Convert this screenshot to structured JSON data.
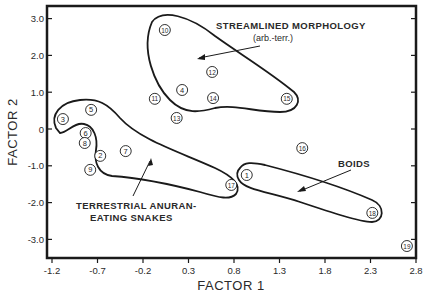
{
  "chart_data": {
    "type": "scatter",
    "title": "",
    "xlabel": "FACTOR 1",
    "ylabel": "FACTOR 2",
    "xlim": [
      -1.2,
      2.8
    ],
    "ylim": [
      -3.5,
      3.3
    ],
    "grid": false,
    "x_ticks": [
      -1.2,
      -0.7,
      -0.2,
      0.3,
      0.8,
      1.3,
      1.8,
      2.3,
      2.8
    ],
    "x_tick_labels": [
      "-1.2",
      "-0.7",
      "-0.2",
      "0.3",
      "0.8",
      "1.3",
      "1.8",
      "2.3",
      "2.8"
    ],
    "y_ticks": [
      3.0,
      2.0,
      1.0,
      0,
      -1.0,
      -2.0,
      -3.0
    ],
    "y_tick_labels": [
      "3.0",
      "2.0",
      "1.0",
      "0",
      "-1.0",
      "-2.0",
      "-3.0"
    ],
    "points": [
      {
        "label": "1",
        "x": 0.94,
        "y": -1.25
      },
      {
        "label": "2",
        "x": -0.67,
        "y": -0.73
      },
      {
        "label": "3",
        "x": -1.08,
        "y": 0.27
      },
      {
        "label": "4",
        "x": 0.23,
        "y": 1.06
      },
      {
        "label": "5",
        "x": -0.77,
        "y": 0.52
      },
      {
        "label": "6",
        "x": -0.83,
        "y": -0.11
      },
      {
        "label": "7",
        "x": -0.39,
        "y": -0.6
      },
      {
        "label": "8",
        "x": -0.84,
        "y": -0.38
      },
      {
        "label": "9",
        "x": -0.78,
        "y": -1.11
      },
      {
        "label": "10",
        "x": 0.04,
        "y": 2.69
      },
      {
        "label": "11",
        "x": -0.07,
        "y": 0.82
      },
      {
        "label": "12",
        "x": 0.56,
        "y": 1.55
      },
      {
        "label": "13",
        "x": 0.17,
        "y": 0.3
      },
      {
        "label": "14",
        "x": 0.57,
        "y": 0.84
      },
      {
        "label": "15",
        "x": 1.38,
        "y": 0.82
      },
      {
        "label": "16",
        "x": 1.55,
        "y": -0.52
      },
      {
        "label": "17",
        "x": 0.77,
        "y": -1.52
      },
      {
        "label": "18",
        "x": 2.32,
        "y": -2.28
      },
      {
        "label": "19",
        "x": 2.7,
        "y": -3.18
      }
    ],
    "groups": [
      {
        "name": "streamlined",
        "members": [
          "10",
          "12",
          "4",
          "14",
          "15"
        ]
      },
      {
        "name": "terrestrial",
        "members": [
          "3",
          "5",
          "6",
          "8",
          "2",
          "9",
          "7",
          "17"
        ]
      },
      {
        "name": "boids",
        "members": [
          "1",
          "18"
        ]
      }
    ],
    "annotations": [
      {
        "id": "streamlined",
        "lines": [
          "STREAMLINED MORPHOLOGY",
          "(arb.-terr.)"
        ]
      },
      {
        "id": "terrestrial",
        "lines": [
          "TERRESTRIAL ANURAN-",
          "EATING SNAKES"
        ]
      },
      {
        "id": "boids",
        "lines": [
          "BOIDS"
        ]
      }
    ]
  },
  "colors": {
    "ink": "#1a1a1a",
    "background": "#ffffff"
  }
}
